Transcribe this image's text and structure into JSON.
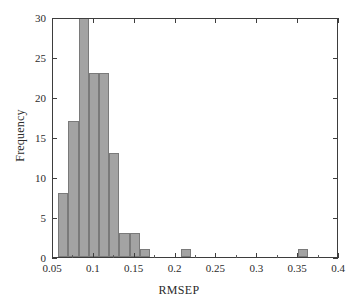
{
  "chart_data": {
    "type": "bar",
    "subtype": "histogram",
    "title": "",
    "xlabel": "RMSEP",
    "ylabel": "Frequency",
    "xlim": [
      0.05,
      0.4
    ],
    "ylim": [
      0,
      30
    ],
    "grid": false,
    "legend": null,
    "bar_color": "#a3a3a3",
    "bar_edge_color": "#7a7a7a",
    "axis_color": "#3d3d3d",
    "bin_width": 0.0125,
    "xticklabels": [
      "0.05",
      "0.1",
      "0.15",
      "0.2",
      "0.25",
      "0.3",
      "0.35",
      "0.4"
    ],
    "xtickvalues": [
      0.05,
      0.1,
      0.15,
      0.2,
      0.25,
      0.3,
      0.35,
      0.4
    ],
    "yticklabels": [
      "0",
      "5",
      "10",
      "15",
      "20",
      "25",
      "30"
    ],
    "ytickvalues": [
      0,
      5,
      10,
      15,
      20,
      25,
      30
    ],
    "note_clipped": "Tallest bar reaches or exceeds the y-axis maximum of 30",
    "bins": [
      {
        "left": 0.0563,
        "right": 0.0688,
        "center": 0.0625,
        "value": 8
      },
      {
        "left": 0.0688,
        "right": 0.0813,
        "center": 0.075,
        "value": 17
      },
      {
        "left": 0.0813,
        "right": 0.0938,
        "center": 0.0875,
        "value": 30
      },
      {
        "left": 0.0938,
        "right": 0.1063,
        "center": 0.1,
        "value": 23
      },
      {
        "left": 0.1063,
        "right": 0.1188,
        "center": 0.1125,
        "value": 23
      },
      {
        "left": 0.1188,
        "right": 0.1313,
        "center": 0.125,
        "value": 13
      },
      {
        "left": 0.1313,
        "right": 0.1438,
        "center": 0.1375,
        "value": 3
      },
      {
        "left": 0.1438,
        "right": 0.1563,
        "center": 0.15,
        "value": 3
      },
      {
        "left": 0.1563,
        "right": 0.1688,
        "center": 0.1625,
        "value": 1
      },
      {
        "left": 0.2063,
        "right": 0.2188,
        "center": 0.2125,
        "value": 1
      },
      {
        "left": 0.35,
        "right": 0.3625,
        "center": 0.3563,
        "value": 1
      }
    ],
    "categories": [
      "0.0625",
      "0.075",
      "0.0875",
      "0.1",
      "0.1125",
      "0.125",
      "0.1375",
      "0.15",
      "0.1625",
      "0.2125",
      "0.3563"
    ],
    "values": [
      8,
      17,
      30,
      23,
      23,
      13,
      3,
      3,
      1,
      1,
      1
    ]
  }
}
